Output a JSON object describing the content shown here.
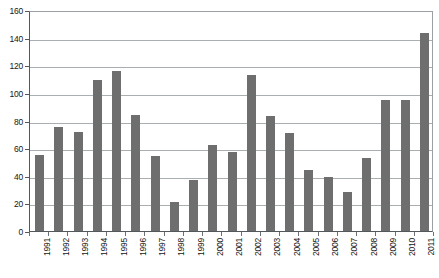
{
  "chart_data": {
    "type": "bar",
    "title": "",
    "subtitle": "",
    "xlabel": "",
    "ylabel": "",
    "categories": [
      "1991",
      "1992",
      "1993",
      "1994",
      "1995",
      "1996",
      "1997",
      "1998",
      "1999",
      "2000",
      "2001",
      "2002",
      "2003",
      "2004",
      "2005",
      "2006",
      "2007",
      "2008",
      "2009",
      "2010",
      "2011"
    ],
    "values": [
      55,
      75,
      72,
      109,
      116,
      84,
      54,
      21,
      37,
      62,
      57,
      113,
      83,
      71,
      44,
      39,
      28,
      53,
      95,
      95,
      143
    ],
    "ylim": [
      0,
      160
    ],
    "ytick_step": 20,
    "yticks": [
      0,
      20,
      40,
      60,
      80,
      100,
      120,
      140,
      160
    ],
    "ytick_labels": [
      "0",
      "20",
      "40",
      "60",
      "80",
      "100",
      "120",
      "140",
      "160"
    ],
    "grid": true,
    "grid_axis": "y",
    "legend": null,
    "legend_position": "none",
    "annotations": [],
    "series": [
      {
        "name": "series-1",
        "values": [
          55,
          75,
          72,
          109,
          116,
          84,
          54,
          21,
          37,
          62,
          57,
          113,
          83,
          71,
          44,
          39,
          28,
          53,
          95,
          95,
          143
        ]
      }
    ],
    "colors": {
      "bar_fill": "#6e6e6e",
      "gridline": "#a9aeb1",
      "axis_line": "#55585a",
      "plot_background": "#ffffff",
      "page_background": "#ffffff",
      "tick_label": "#161616"
    },
    "x_label_rotation": 90
  }
}
